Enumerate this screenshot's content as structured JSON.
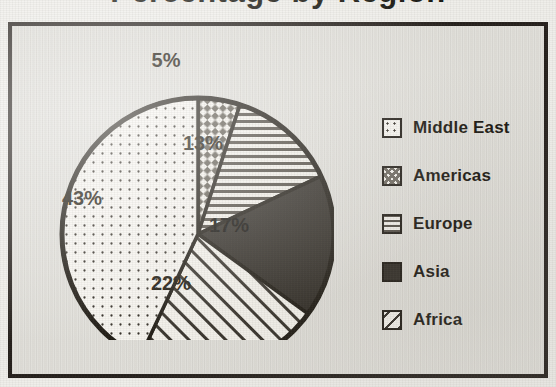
{
  "title": "Percentage by Region",
  "chart_data": {
    "type": "pie",
    "title": "Percentage by Region",
    "legend_position": "right",
    "categories": [
      "Middle East",
      "Americas",
      "Europe",
      "Asia",
      "Africa"
    ],
    "values": [
      43,
      5,
      13,
      17,
      22
    ],
    "value_labels": [
      "43%",
      "5%",
      "13%",
      "17%",
      "22%"
    ],
    "units": "percent",
    "slice_order_clockwise_from_top": [
      "Americas",
      "Europe",
      "Asia",
      "Africa",
      "Middle East"
    ],
    "slices": [
      {
        "label": "Americas",
        "value": 5,
        "value_label": "5%",
        "pattern": "checkerboard",
        "fill": "#f4f2ec",
        "ink": "#6a655c",
        "label_color": "#171309",
        "label_x": 196,
        "label_y": 58
      },
      {
        "label": "Europe",
        "value": 13,
        "value_label": "13%",
        "pattern": "horizontal-lines",
        "fill": "#f2f0ea",
        "ink": "#4f4a42",
        "label_color": "#171309",
        "label_x": 233,
        "label_y": 141
      },
      {
        "label": "Asia",
        "value": 17,
        "value_label": "17%",
        "pattern": "solid",
        "fill": "#2e2a24",
        "ink": "#2e2a24",
        "label_color": "#0d0b07",
        "label_x": 259,
        "label_y": 223
      },
      {
        "label": "Africa",
        "value": 22,
        "value_label": "22%",
        "pattern": "diagonal-lines",
        "fill": "#f4f2ec",
        "ink": "#2f2b25",
        "label_color": "#171309",
        "label_x": 201,
        "label_y": 281
      },
      {
        "label": "Middle East",
        "value": 43,
        "value_label": "43%",
        "pattern": "dots",
        "fill": "#f6f4ef",
        "ink": "#2b261f",
        "label_color": "#171309",
        "label_x": 112,
        "label_y": 196
      }
    ],
    "legend": [
      {
        "label": "Middle East",
        "pattern": "dots",
        "swatch_class": "sw-dots"
      },
      {
        "label": "Americas",
        "pattern": "checkerboard",
        "swatch_class": "sw-check"
      },
      {
        "label": "Europe",
        "pattern": "horizontal-lines",
        "swatch_class": "sw-hlines"
      },
      {
        "label": "Asia",
        "pattern": "solid",
        "swatch_class": "sw-solid"
      },
      {
        "label": "Africa",
        "pattern": "diagonal-lines",
        "swatch_class": "sw-diag"
      }
    ]
  },
  "colors": {
    "page_background": "#efeeea",
    "frame_border": "#241f1b",
    "frame_background": "#e7e6e1",
    "pie_outline": "#1c1811",
    "text": "#191610"
  }
}
